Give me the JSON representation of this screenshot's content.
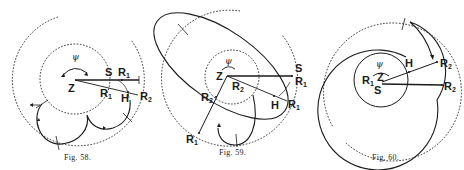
{
  "figures": [
    {
      "id": "fig58",
      "caption": "Fig. 58.",
      "labels": {
        "psi": "ψ",
        "Z": "Z",
        "S": "S",
        "R1_top": "R",
        "R1_top_sub": "1",
        "R1_low": "R",
        "R1_low_sub": "1",
        "H": "H",
        "R2": "R",
        "R2_sub": "2"
      }
    },
    {
      "id": "fig59",
      "caption": "Fig. 59.",
      "labels": {
        "psi": "ψ",
        "Z": "Z",
        "S": "S",
        "R1_right": "R",
        "R1_right_sub": "1",
        "R2_inner": "R",
        "R2_inner_sub": "2",
        "H": "H",
        "R1_mid": "R",
        "R1_mid_sub": "1",
        "R2_left": "R",
        "R2_left_sub": "2",
        "R1_bottom": "R",
        "R1_bottom_sub": "1"
      }
    },
    {
      "id": "fig60",
      "caption": "Fig. 60.",
      "labels": {
        "psi": "ψ",
        "Z": "Z",
        "R1": "R",
        "R1_sub": "1",
        "S": "S",
        "H": "H",
        "R2_top": "R",
        "R2_top_sub": "2",
        "R2_bottom": "R",
        "R2_bottom_sub": "2"
      }
    }
  ]
}
